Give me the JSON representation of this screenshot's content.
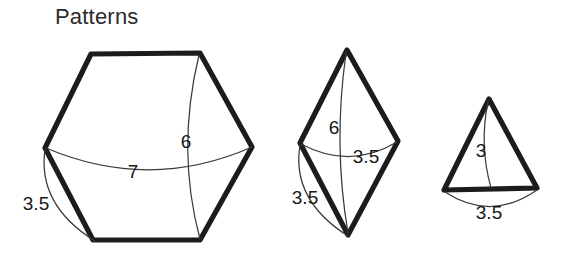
{
  "page": {
    "title": "Patterns",
    "background_color": "#ffffff",
    "ink_color": "#1c1c1c",
    "arc_color": "#3a3a3a"
  },
  "figures": [
    {
      "name": "hexagon",
      "shape": "hexagon",
      "dimensions": [
        {
          "id": "hex-width",
          "label": "7"
        },
        {
          "id": "hex-height",
          "label": "6"
        },
        {
          "id": "hex-side",
          "label": "3.5"
        }
      ]
    },
    {
      "name": "rhombus",
      "shape": "rhombus",
      "dimensions": [
        {
          "id": "rhombus-height",
          "label": "6"
        },
        {
          "id": "rhombus-width",
          "label": "3.5"
        },
        {
          "id": "rhombus-side",
          "label": "3.5"
        }
      ]
    },
    {
      "name": "triangle",
      "shape": "triangle",
      "dimensions": [
        {
          "id": "triangle-height",
          "label": "3"
        },
        {
          "id": "triangle-base",
          "label": "3.5"
        }
      ]
    }
  ],
  "labels": {
    "hex_7": "7",
    "hex_6": "6",
    "hex_35": "3.5",
    "rhombus_6": "6",
    "rhombus_35_width": "3.5",
    "rhombus_35_side": "3.5",
    "triangle_3": "3",
    "triangle_35": "3.5"
  }
}
